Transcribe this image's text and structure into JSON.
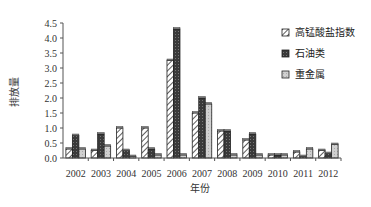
{
  "chart_data": {
    "type": "bar",
    "title": "",
    "xlabel": "年份",
    "ylabel": "排放量",
    "ylim": [
      0,
      4.5
    ],
    "yticks": [
      "0.0",
      "0.5",
      "1.0",
      "1.5",
      "2.0",
      "2.5",
      "3.0",
      "3.5",
      "4.0",
      "4.5"
    ],
    "categories": [
      "2002",
      "2003",
      "2004",
      "2005",
      "2006",
      "2007",
      "2008",
      "2009",
      "2010",
      "2011",
      "2012"
    ],
    "series": [
      {
        "name": "高锰酸盐指数",
        "pattern": "hatch",
        "values": [
          0.3,
          0.25,
          1.0,
          1.0,
          3.25,
          1.5,
          0.9,
          0.6,
          0.1,
          0.2,
          0.25
        ]
      },
      {
        "name": "石油类",
        "pattern": "dark",
        "values": [
          0.75,
          0.8,
          0.25,
          0.3,
          4.3,
          2.0,
          0.9,
          0.8,
          0.1,
          0.05,
          0.15
        ]
      },
      {
        "name": "重金属",
        "pattern": "light",
        "values": [
          0.3,
          0.4,
          0.05,
          0.1,
          0.1,
          1.8,
          0.1,
          0.1,
          0.1,
          0.3,
          0.45
        ]
      }
    ],
    "legend_position": "right",
    "grid": false
  }
}
